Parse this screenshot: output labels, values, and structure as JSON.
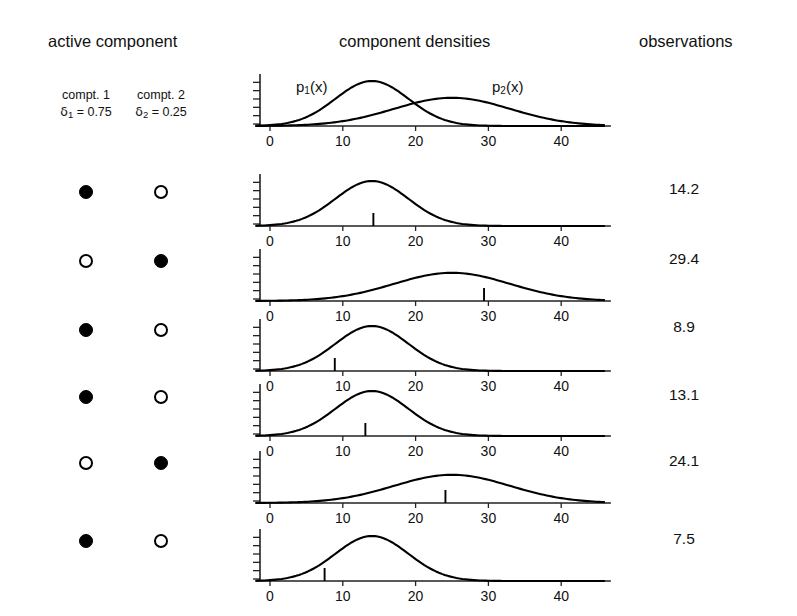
{
  "headers": {
    "active_component": "active component",
    "component_densities": "component densities",
    "observations": "observations"
  },
  "legend": {
    "comp1_name": "compt. 1",
    "comp2_name": "compt. 2",
    "comp1_weight": "δ1 = 0.75",
    "comp2_weight": "δ2 = 0.25",
    "delta_glyph": "δ",
    "comp1_weight_value": 0.75,
    "comp2_weight_value": 0.25
  },
  "curve_labels": {
    "p1": "p1(x)",
    "p2": "p2(x)"
  },
  "axis": {
    "tick_labels": [
      "0",
      "10",
      "20",
      "30",
      "40"
    ],
    "tick_values": [
      0,
      10,
      20,
      30,
      40
    ],
    "xmin": -2,
    "xmax": 46,
    "y_tick_count": 6
  },
  "chart_data": {
    "type": "line",
    "title": "component densities",
    "xlabel": "",
    "ylabel": "",
    "xlim": [
      -2,
      46
    ],
    "ylim": [
      0,
      0.085
    ],
    "grid": false,
    "legend_position": "inline-annotations",
    "components": [
      {
        "name": "p1(x)",
        "mean": 14,
        "sd": 5,
        "weight": 0.75,
        "peak_density": 0.0798
      },
      {
        "name": "p2(x)",
        "mean": 25,
        "sd": 8,
        "weight": 0.25,
        "peak_density": 0.0499
      }
    ],
    "series": [
      {
        "name": "p1(x)",
        "mean": 14,
        "sd": 5
      },
      {
        "name": "p2(x)",
        "mean": 25,
        "sd": 8
      }
    ],
    "rows": [
      {
        "index": 1,
        "active_component": 1,
        "comp1": "filled",
        "comp2": "open",
        "observation": 14.2
      },
      {
        "index": 2,
        "active_component": 2,
        "comp1": "open",
        "comp2": "filled",
        "observation": 29.4
      },
      {
        "index": 3,
        "active_component": 1,
        "comp1": "filled",
        "comp2": "open",
        "observation": 8.9
      },
      {
        "index": 4,
        "active_component": 1,
        "comp1": "filled",
        "comp2": "open",
        "observation": 13.1
      },
      {
        "index": 5,
        "active_component": 2,
        "comp1": "open",
        "comp2": "filled",
        "observation": 24.1
      },
      {
        "index": 6,
        "active_component": 1,
        "comp1": "filled",
        "comp2": "open",
        "observation": 7.5
      }
    ],
    "observations": [
      14.2,
      29.4,
      8.9,
      13.1,
      24.1,
      7.5
    ]
  },
  "rows": [
    {
      "observation_label": "14.2"
    },
    {
      "observation_label": "29.4"
    },
    {
      "observation_label": "8.9"
    },
    {
      "observation_label": "13.1"
    },
    {
      "observation_label": "24.1"
    },
    {
      "observation_label": "7.5"
    }
  ],
  "colors": {
    "ink": "#000000",
    "background": "#ffffff",
    "axis": "#222222"
  }
}
